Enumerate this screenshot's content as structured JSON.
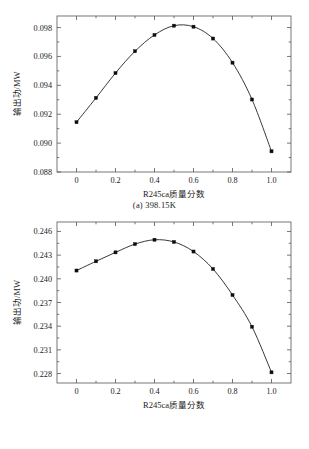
{
  "figures": [
    {
      "id": "a",
      "caption": "(a)  398.15K",
      "chart": {
        "type": "line",
        "title": "",
        "xlabel": "R245ca质量分数",
        "ylabel": "输出功/MW",
        "xlim": [
          -0.1,
          1.1
        ],
        "ylim": [
          0.088,
          0.0988
        ],
        "xticks": [
          0,
          0.2,
          0.4,
          0.6,
          0.8,
          1.0
        ],
        "xticklabels": [
          "0",
          "0.2",
          "0.4",
          "0.6",
          "0.8",
          "1.0"
        ],
        "yticks": [
          0.088,
          0.09,
          0.092,
          0.094,
          0.096,
          0.098
        ],
        "yticklabels": [
          "0.088",
          "0.090",
          "0.092",
          "0.094",
          "0.096",
          "0.098"
        ],
        "x_minor_count": 1,
        "y_minor_count": 1,
        "grid": false,
        "legend": null,
        "marker": "square",
        "x": [
          0.0,
          0.1,
          0.2,
          0.3,
          0.4,
          0.5,
          0.6,
          0.7,
          0.8,
          0.9,
          1.0
        ],
        "y": [
          0.09145,
          0.09313,
          0.09485,
          0.09636,
          0.09749,
          0.09813,
          0.09806,
          0.09724,
          0.09557,
          0.09302,
          0.08943
        ]
      }
    },
    {
      "id": "b",
      "caption": "(b)  438.15K",
      "chart": {
        "type": "line",
        "title": "",
        "xlabel": "R245ca质量分数",
        "ylabel": "输出功/MW",
        "xlim": [
          -0.1,
          1.1
        ],
        "ylim": [
          0.2268,
          0.2472
        ],
        "xticks": [
          0,
          0.2,
          0.4,
          0.6,
          0.8,
          1.0
        ],
        "xticklabels": [
          "0",
          "0.2",
          "0.4",
          "0.6",
          "0.8",
          "1.0"
        ],
        "yticks": [
          0.228,
          0.231,
          0.234,
          0.237,
          0.24,
          0.243,
          0.246
        ],
        "yticklabels": [
          "0.228",
          "0.231",
          "0.234",
          "0.237",
          "0.240",
          "0.243",
          "0.246"
        ],
        "x_minor_count": 1,
        "y_minor_count": 1,
        "grid": false,
        "legend": null,
        "marker": "square",
        "x": [
          0.0,
          0.1,
          0.2,
          0.3,
          0.4,
          0.5,
          0.6,
          0.7,
          0.8,
          0.9,
          1.0
        ],
        "y": [
          0.24105,
          0.24222,
          0.24335,
          0.2444,
          0.24495,
          0.24467,
          0.24346,
          0.24125,
          0.23795,
          0.23393,
          0.22815
        ]
      }
    }
  ]
}
